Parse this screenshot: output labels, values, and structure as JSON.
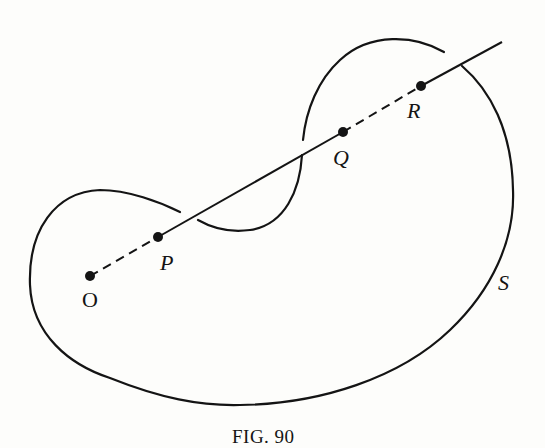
{
  "figure": {
    "caption": "Fig. 90",
    "caption_display": "FIG. 90",
    "points": [
      {
        "id": "O",
        "label": "O",
        "x": 90,
        "y": 276,
        "italic": false
      },
      {
        "id": "P",
        "label": "P",
        "x": 158,
        "y": 237,
        "italic": true
      },
      {
        "id": "Q",
        "label": "Q",
        "x": 343,
        "y": 132,
        "italic": true
      },
      {
        "id": "R",
        "label": "R",
        "x": 421,
        "y": 86,
        "italic": true
      }
    ],
    "surface_label": "S",
    "segments": [
      {
        "from": "O",
        "to": "P",
        "style": "dashed"
      },
      {
        "from": "P",
        "to": "Q",
        "style": "solid"
      },
      {
        "from": "Q",
        "to": "R",
        "style": "dashed"
      },
      {
        "from": "R",
        "to": "beyond",
        "style": "solid"
      }
    ],
    "colors": {
      "ink": "#141414",
      "paper": "#fdfdfb"
    }
  }
}
